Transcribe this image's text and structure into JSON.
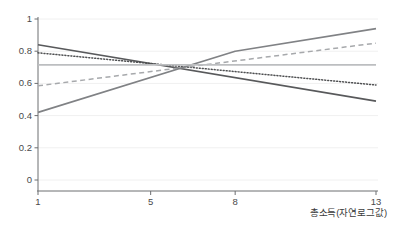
{
  "chart_data": {
    "type": "line",
    "title": "",
    "subtitle": "",
    "xlabel": "총소득(자연로그값)",
    "ylabel": "",
    "xlim": [
      1,
      13
    ],
    "ylim": [
      0,
      1
    ],
    "grid": true,
    "legend": "none",
    "x_ticks": [
      1,
      5,
      8,
      13
    ],
    "x_tick_labels": [
      "1",
      "5",
      "8",
      "13"
    ],
    "y_ticks": [
      0,
      0.2,
      0.4,
      0.6,
      0.8,
      1
    ],
    "y_tick_labels": [
      "0",
      "0.2",
      "0.4",
      "0.6",
      "0.8",
      "1"
    ],
    "series": [
      {
        "name": "declining-solid-dark",
        "style": "solid",
        "color": "#58595b",
        "width": 1.6,
        "x": [
          1,
          13
        ],
        "values": [
          0.84,
          0.49
        ]
      },
      {
        "name": "declining-dotted",
        "style": "dotted",
        "color": "#4f5052",
        "width": 1.5,
        "x": [
          1,
          13
        ],
        "values": [
          0.79,
          0.59
        ]
      },
      {
        "name": "rising-dashed",
        "style": "dashed",
        "color": "#a7a9ac",
        "width": 1.5,
        "x": [
          1,
          13
        ],
        "values": [
          0.585,
          0.85
        ]
      },
      {
        "name": "rising-solid-gray",
        "style": "solid",
        "color": "#808285",
        "width": 1.6,
        "x": [
          1,
          8,
          13
        ],
        "values": [
          0.42,
          0.8,
          0.94
        ]
      },
      {
        "name": "constant-horizontal",
        "style": "solid",
        "color": "#bcbec0",
        "width": 1.6,
        "x": [
          1,
          13
        ],
        "values": [
          0.715,
          0.715
        ]
      }
    ]
  },
  "axes": {
    "x_title": "총소득(자연로그값)"
  }
}
